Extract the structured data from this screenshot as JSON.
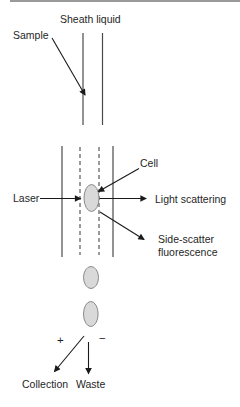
{
  "figure": {
    "title_semantic": "Flow cytometry cell sorting diagram",
    "labels": {
      "sheath_liquid": "Sheath liquid",
      "sample": "Sample",
      "laser": "Laser",
      "cell": "Cell",
      "light_scattering": "Light scattering",
      "side_scatter_line1": "Side-scatter",
      "side_scatter_line2": "fluorescence",
      "plus_sign": "+",
      "minus_sign": "−",
      "collection": "Collection",
      "waste": "Waste"
    },
    "colors": {
      "background": "#ffffff",
      "line": "#4a4a4a",
      "arrow": "#1a1a1a",
      "cell_fill": "#d9d9d9",
      "cell_stroke": "#8a8a8a",
      "top_rule": "#9a9a9a",
      "text": "#1f1f1f"
    }
  }
}
